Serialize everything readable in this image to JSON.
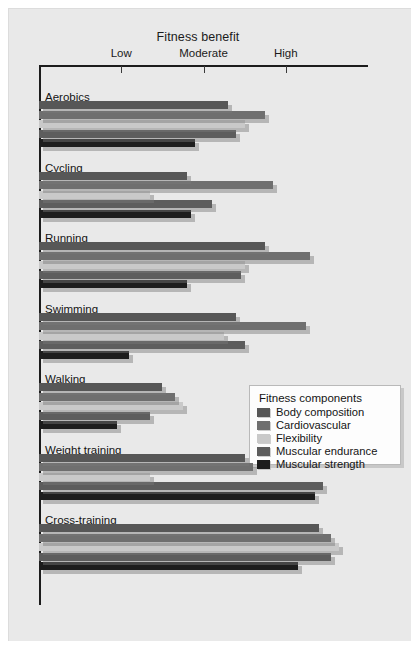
{
  "chart_data": {
    "type": "bar",
    "orientation": "horizontal",
    "title": "Fitness benefit",
    "xlabel": "",
    "ylabel": "",
    "xlim": [
      0,
      4
    ],
    "grid": false,
    "legend_position": "center-right",
    "legend_title": "Fitness components",
    "tick_labels": [
      "Low",
      "Moderate",
      "High"
    ],
    "tick_values": [
      1,
      2,
      3
    ],
    "categories": [
      "Aerobics",
      "Cycling",
      "Running",
      "Swimming",
      "Walking",
      "Weight training",
      "Cross-training"
    ],
    "series": [
      {
        "name": "Body composition",
        "color": "#575757",
        "values": [
          2.3,
          1.8,
          2.75,
          2.4,
          1.5,
          2.5,
          3.4
        ]
      },
      {
        "name": "Cardiovascular",
        "color": "#6f6f6f",
        "values": [
          2.75,
          2.85,
          3.3,
          3.25,
          1.65,
          2.6,
          3.55
        ]
      },
      {
        "name": "Flexibility",
        "color": "#c9c9c9",
        "values": [
          2.5,
          1.35,
          2.5,
          2.25,
          1.75,
          1.35,
          3.65
        ]
      },
      {
        "name": "Muscular endurance",
        "color": "#5d5d5d",
        "values": [
          2.4,
          2.1,
          2.45,
          2.5,
          1.35,
          3.45,
          3.55
        ]
      },
      {
        "name": "Muscular strength",
        "color": "#1d1d1d",
        "values": [
          1.9,
          1.85,
          1.8,
          1.1,
          0.95,
          3.35,
          3.15
        ]
      }
    ]
  },
  "scrollbar": {
    "label": "horizontal-scrollbar"
  }
}
